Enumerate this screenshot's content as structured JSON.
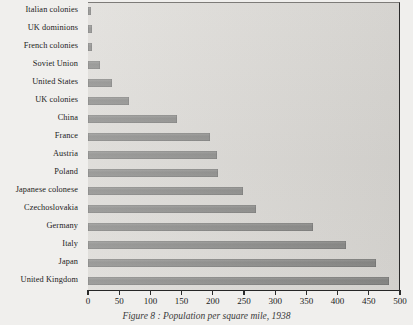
{
  "caption": "Figure 8 : Population per square mile, 1938",
  "colors": {
    "page_background": "#f0efed",
    "plot_background": "#dcdad6",
    "bar_fill": "#8a8a88",
    "axis": "#262626",
    "text": "#1b1b1b"
  },
  "chart_data": {
    "type": "bar",
    "orientation": "horizontal",
    "title": "Figure 8 : Population per square mile, 1938",
    "xlabel": "",
    "ylabel": "",
    "xlim": [
      0,
      500
    ],
    "xticks": [
      0,
      50,
      100,
      150,
      200,
      250,
      300,
      350,
      400,
      450,
      500
    ],
    "grid": false,
    "legend": false,
    "categories": [
      "Italian colonies",
      "UK dominions",
      "French colonies",
      "Soviet Union",
      "United States",
      "UK colonies",
      "China",
      "France",
      "Austria",
      "Poland",
      "Japanese colonese",
      "Czechoslovakia",
      "Germany",
      "Italy",
      "Japan",
      "United Kingdom"
    ],
    "values": [
      5,
      6,
      6,
      20,
      38,
      66,
      142,
      196,
      206,
      209,
      248,
      269,
      361,
      414,
      462,
      483
    ]
  }
}
